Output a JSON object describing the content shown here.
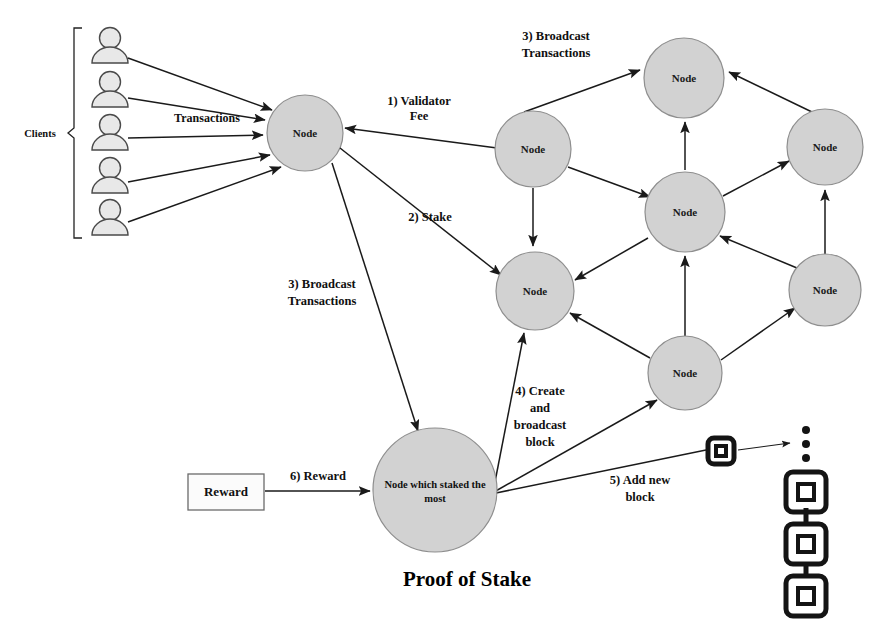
{
  "title": "Proof of Stake",
  "groups": {
    "clients_label": "Clients"
  },
  "edge_labels": {
    "transactions": "Transactions",
    "validator_fee_line1": "1) Validator",
    "validator_fee_line2": "Fee",
    "stake": "2) Stake",
    "broadcast_left_line1": "3) Broadcast",
    "broadcast_left_line2": "Transactions",
    "broadcast_right_line1": "3) Broadcast",
    "broadcast_right_line2": "Transactions",
    "create_block_line1": "4) Create",
    "create_block_line2": "and",
    "create_block_line3": "broadcast",
    "create_block_line4": "block",
    "add_block_line1": "5) Add new",
    "add_block_line2": "block",
    "reward_step": "6) Reward"
  },
  "nodes": {
    "entry": {
      "label": "Node",
      "cx": 305,
      "cy": 133,
      "r": 38
    },
    "net_left_top": {
      "label": "Node",
      "cx": 533,
      "cy": 149,
      "r": 38
    },
    "net_top": {
      "label": "Node",
      "cx": 684,
      "cy": 78,
      "r": 40
    },
    "net_right_top": {
      "label": "Node",
      "cx": 825,
      "cy": 147,
      "r": 38
    },
    "net_center": {
      "label": "Node",
      "cx": 685,
      "cy": 212,
      "r": 40
    },
    "net_left_bottom": {
      "label": "Node",
      "cx": 535,
      "cy": 291,
      "r": 39
    },
    "net_right_bottom": {
      "label": "Node",
      "cx": 825,
      "cy": 290,
      "r": 36
    },
    "net_bottom": {
      "label": "Node",
      "cx": 685,
      "cy": 373,
      "r": 37
    },
    "staker": {
      "label_line1": "Node which staked the",
      "label_line2": "most",
      "cx": 435,
      "cy": 490,
      "r": 62
    }
  },
  "reward": {
    "label": "Reward",
    "x": 188,
    "y": 474,
    "width": 76,
    "height": 36
  },
  "clients": [
    {
      "cx": 110,
      "cy": 48
    },
    {
      "cx": 110,
      "cy": 92
    },
    {
      "cx": 110,
      "cy": 135
    },
    {
      "cx": 110,
      "cy": 178
    },
    {
      "cx": 110,
      "cy": 220
    }
  ],
  "blockchain": {
    "new_block": {
      "x": 706,
      "y": 436,
      "size": 28
    },
    "ellipsis_dots": 3,
    "chain_blocks": 3
  },
  "colors": {
    "node_fill": "#d2d2d2",
    "node_stroke": "#8e8e8e",
    "person_fill": "#e8e8e8",
    "line": "#1a1a1a",
    "text": "#101010",
    "background": "#ffffff"
  }
}
